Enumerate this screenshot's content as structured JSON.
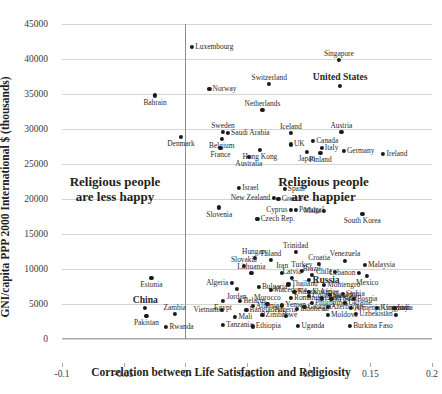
{
  "chart_data": {
    "type": "scatter",
    "title": "",
    "xlabel": "Correlation between Life Satisfaction and Religiosity",
    "ylabel": "GNI/capita PPP 2000 International $ (thousands)",
    "xlim": [
      -0.1,
      0.2
    ],
    "ylim": [
      0,
      45000
    ],
    "xticks": [
      "-0.1",
      "-0.05",
      "0",
      "0.05",
      "0.1",
      "0.15",
      "0.2"
    ],
    "xtick_values": [
      -0.1,
      -0.05,
      0,
      0.05,
      0.1,
      0.15,
      0.2
    ],
    "yticks": [
      "0",
      "5000",
      "10000",
      "15000",
      "20000",
      "25000",
      "30000",
      "35000",
      "40000",
      "45000"
    ],
    "ytick_values": [
      0,
      5000,
      10000,
      15000,
      20000,
      25000,
      30000,
      35000,
      40000,
      45000
    ],
    "grid": "horizontal",
    "legend": "none",
    "zero_reference_line_x": 0,
    "annotations": [
      {
        "name": "less-happy-note",
        "line1": "Religious people",
        "line2": "are less happy",
        "x": -0.057,
        "y": 21500
      },
      {
        "name": "happier-note",
        "line1": "Religious people",
        "line2": "are happier",
        "x": 0.112,
        "y": 21500
      }
    ],
    "points": [
      {
        "label": "Luxembourg",
        "x": 0.0055,
        "y": 41700,
        "pos": "right",
        "bold": false
      },
      {
        "label": "Singapore",
        "x": 0.1245,
        "y": 39900,
        "pos": "above",
        "bold": false
      },
      {
        "label": "Switzerland",
        "x": 0.068,
        "y": 36400,
        "pos": "above",
        "bold": false
      },
      {
        "label": "United States",
        "x": 0.1255,
        "y": 36200,
        "pos": "above",
        "bold": true
      },
      {
        "label": "Norway",
        "x": 0.0195,
        "y": 35700,
        "pos": "right",
        "bold": false
      },
      {
        "label": "Bahrain",
        "x": -0.0245,
        "y": 34800,
        "pos": "below",
        "bold": false
      },
      {
        "label": "Netherlands",
        "x": 0.0625,
        "y": 32700,
        "pos": "above",
        "bold": false
      },
      {
        "label": "Sweden",
        "x": 0.0305,
        "y": 29600,
        "pos": "above",
        "bold": false
      },
      {
        "label": "Saudi Arabia",
        "x": 0.0345,
        "y": 29500,
        "pos": "right",
        "bold": false
      },
      {
        "label": "Iceland",
        "x": 0.0855,
        "y": 29400,
        "pos": "above",
        "bold": false
      },
      {
        "label": "Austria",
        "x": 0.1265,
        "y": 29600,
        "pos": "above",
        "bold": false
      },
      {
        "label": "Denmark",
        "x": -0.0035,
        "y": 28900,
        "pos": "below",
        "bold": false
      },
      {
        "label": "Belgium",
        "x": 0.0295,
        "y": 28600,
        "pos": "below",
        "bold": false
      },
      {
        "label": "Canada",
        "x": 0.1035,
        "y": 28300,
        "pos": "right",
        "bold": false
      },
      {
        "label": "UK",
        "x": 0.0855,
        "y": 27800,
        "pos": "right",
        "bold": false
      },
      {
        "label": "France",
        "x": 0.0285,
        "y": 27300,
        "pos": "below",
        "bold": false
      },
      {
        "label": "Hong Kong",
        "x": 0.0605,
        "y": 27000,
        "pos": "below",
        "bold": false
      },
      {
        "label": "Italy",
        "x": 0.1105,
        "y": 27300,
        "pos": "right",
        "bold": false
      },
      {
        "label": "Germany",
        "x": 0.1285,
        "y": 26900,
        "pos": "right",
        "bold": false
      },
      {
        "label": "Japan",
        "x": 0.0985,
        "y": 26700,
        "pos": "below",
        "bold": false
      },
      {
        "label": "Finland",
        "x": 0.1095,
        "y": 26600,
        "pos": "below",
        "bold": false
      },
      {
        "label": "Ireland",
        "x": 0.1605,
        "y": 26400,
        "pos": "right",
        "bold": false
      },
      {
        "label": "Australia",
        "x": 0.0515,
        "y": 26000,
        "pos": "below",
        "bold": false
      },
      {
        "label": "Israel",
        "x": 0.0435,
        "y": 21600,
        "pos": "right",
        "bold": false
      },
      {
        "label": "Spain",
        "x": 0.0805,
        "y": 21500,
        "pos": "right",
        "bold": false
      },
      {
        "label": "New Zealand",
        "x": 0.0715,
        "y": 20100,
        "pos": "left",
        "bold": false
      },
      {
        "label": "Greece",
        "x": 0.0755,
        "y": 20000,
        "pos": "right",
        "bold": false
      },
      {
        "label": "Slovenia",
        "x": 0.0275,
        "y": 18800,
        "pos": "below",
        "bold": false
      },
      {
        "label": "Cyprus",
        "x": 0.0855,
        "y": 18500,
        "pos": "left",
        "bold": false
      },
      {
        "label": "Portugal",
        "x": 0.0895,
        "y": 18400,
        "pos": "right",
        "bold": false
      },
      {
        "label": "Malta",
        "x": 0.1125,
        "y": 18300,
        "pos": "left",
        "bold": false
      },
      {
        "label": "South Korea",
        "x": 0.1435,
        "y": 17900,
        "pos": "below",
        "bold": false
      },
      {
        "label": "Czech Rep.",
        "x": 0.0585,
        "y": 17100,
        "pos": "right",
        "bold": false
      },
      {
        "label": "Trinidad",
        "x": 0.0895,
        "y": 12400,
        "pos": "above",
        "bold": false
      },
      {
        "label": "Hungary",
        "x": 0.0565,
        "y": 11600,
        "pos": "above",
        "bold": false
      },
      {
        "label": "Poland",
        "x": 0.0695,
        "y": 11300,
        "pos": "above",
        "bold": false
      },
      {
        "label": "Venezuela",
        "x": 0.1295,
        "y": 11200,
        "pos": "above",
        "bold": false
      },
      {
        "label": "Croatia",
        "x": 0.1085,
        "y": 10700,
        "pos": "above",
        "bold": false
      },
      {
        "label": "Malaysia",
        "x": 0.1455,
        "y": 10600,
        "pos": "right",
        "bold": false
      },
      {
        "label": "Slovakia",
        "x": 0.0475,
        "y": 10400,
        "pos": "above",
        "bold": false
      },
      {
        "label": "Turkey",
        "x": 0.0945,
        "y": 9700,
        "pos": "above",
        "bold": false
      },
      {
        "label": "Chile",
        "x": 0.1215,
        "y": 9600,
        "pos": "left",
        "bold": false
      },
      {
        "label": "Lebanon",
        "x": 0.1405,
        "y": 9500,
        "pos": "left",
        "bold": false
      },
      {
        "label": "Lithuania",
        "x": 0.0535,
        "y": 9400,
        "pos": "above",
        "bold": false
      },
      {
        "label": "Iran",
        "x": 0.0785,
        "y": 9500,
        "pos": "above",
        "bold": false
      },
      {
        "label": "Brazil",
        "x": 0.1025,
        "y": 9100,
        "pos": "above",
        "bold": false
      },
      {
        "label": "Mexico",
        "x": 0.1475,
        "y": 9000,
        "pos": "below",
        "bold": false
      },
      {
        "label": "Estonia",
        "x": -0.0275,
        "y": 8700,
        "pos": "below",
        "bold": false
      },
      {
        "label": "Latvia",
        "x": 0.0865,
        "y": 8700,
        "pos": "above",
        "bold": false
      },
      {
        "label": "Russia",
        "x": 0.1005,
        "y": 8400,
        "pos": "right",
        "bold": true
      },
      {
        "label": "Algeria",
        "x": 0.0375,
        "y": 8000,
        "pos": "left",
        "bold": false
      },
      {
        "label": "Thailand",
        "x": 0.0835,
        "y": 7800,
        "pos": "right",
        "bold": false
      },
      {
        "label": "Montengro",
        "x": 0.1125,
        "y": 7700,
        "pos": "right",
        "bold": false
      },
      {
        "label": "Bulgaria",
        "x": 0.0595,
        "y": 7500,
        "pos": "right",
        "bold": false
      },
      {
        "label": "Jordan",
        "x": 0.0415,
        "y": 7100,
        "pos": "below",
        "bold": false
      },
      {
        "label": "Macedonia",
        "x": 0.0695,
        "y": 7000,
        "pos": "right",
        "bold": false
      },
      {
        "label": "Kazakhstan",
        "x": 0.0885,
        "y": 6700,
        "pos": "right",
        "bold": false
      },
      {
        "label": "S. Africa",
        "x": 0.1005,
        "y": 6700,
        "pos": "right",
        "bold": false
      },
      {
        "label": "Serbia",
        "x": 0.1275,
        "y": 6400,
        "pos": "right",
        "bold": false
      },
      {
        "label": "Colombia",
        "x": 0.1005,
        "y": 6100,
        "pos": "right",
        "bold": false
      },
      {
        "label": "Ecuador",
        "x": 0.1175,
        "y": 6300,
        "pos": "right",
        "bold": false
      },
      {
        "label": "Romania",
        "x": 0.0855,
        "y": 5900,
        "pos": "right",
        "bold": false
      },
      {
        "label": "Guatemala",
        "x": 0.1105,
        "y": 5800,
        "pos": "right",
        "bold": false
      },
      {
        "label": "El Salv.",
        "x": 0.1185,
        "y": 5700,
        "pos": "right",
        "bold": false
      },
      {
        "label": "Bosnia",
        "x": 0.1365,
        "y": 5700,
        "pos": "right",
        "bold": false
      },
      {
        "label": "Egypt",
        "x": 0.0305,
        "y": 5400,
        "pos": "below",
        "bold": false
      },
      {
        "label": "Belarus",
        "x": 0.0445,
        "y": 5400,
        "pos": "right",
        "bold": false
      },
      {
        "label": "Philippines",
        "x": 0.1025,
        "y": 5200,
        "pos": "right",
        "bold": false
      },
      {
        "label": "Ukraine",
        "x": 0.1295,
        "y": 5100,
        "pos": "right",
        "bold": false
      },
      {
        "label": "Morocco",
        "x": 0.0665,
        "y": 5000,
        "pos": "above",
        "bold": false
      },
      {
        "label": "Yemen",
        "x": 0.0785,
        "y": 4800,
        "pos": "right",
        "bold": false
      },
      {
        "label": "Albania",
        "x": 0.0545,
        "y": 4700,
        "pos": "right",
        "bold": false
      },
      {
        "label": "Georgia",
        "x": 0.0965,
        "y": 4600,
        "pos": "right",
        "bold": false
      },
      {
        "label": "Azerbaijan",
        "x": 0.1155,
        "y": 4600,
        "pos": "right",
        "bold": false
      },
      {
        "label": "Armenia",
        "x": 0.1345,
        "y": 4500,
        "pos": "right",
        "bold": false
      },
      {
        "label": "China",
        "x": -0.0325,
        "y": 4400,
        "pos": "above",
        "bold": true
      },
      {
        "label": "Vietnam",
        "x": 0.0295,
        "y": 4200,
        "pos": "left",
        "bold": false
      },
      {
        "label": "Bangladesh",
        "x": 0.0495,
        "y": 4200,
        "pos": "right",
        "bold": false
      },
      {
        "label": "Indonesia",
        "x": 0.0905,
        "y": 4300,
        "pos": "right",
        "bold": false
      },
      {
        "label": "Kyrgzstan",
        "x": 0.1555,
        "y": 4400,
        "pos": "right",
        "bold": false
      },
      {
        "label": "India",
        "x": 0.1695,
        "y": 4500,
        "pos": "right",
        "bold": false
      },
      {
        "label": "Zambia",
        "x": -0.0085,
        "y": 3600,
        "pos": "above",
        "bold": false
      },
      {
        "label": "Zimbabwe",
        "x": 0.0625,
        "y": 3500,
        "pos": "right",
        "bold": false
      },
      {
        "label": "Moldova",
        "x": 0.1155,
        "y": 3500,
        "pos": "right",
        "bold": false
      },
      {
        "label": "Uzbekistan",
        "x": 0.1385,
        "y": 3600,
        "pos": "right",
        "bold": false
      },
      {
        "label": "Nigeria",
        "x": 0.0815,
        "y": 3300,
        "pos": "above",
        "bold": false
      },
      {
        "label": "Pakistan",
        "x": -0.0315,
        "y": 3300,
        "pos": "below",
        "bold": false
      },
      {
        "label": "Mali",
        "x": 0.0405,
        "y": 3200,
        "pos": "right",
        "bold": false
      },
      {
        "label": "Uruguay",
        "x": 0.1705,
        "y": 3500,
        "pos": "above",
        "bold": false
      },
      {
        "label": "Rwanda",
        "x": -0.0155,
        "y": 1700,
        "pos": "right",
        "bold": false
      },
      {
        "label": "Tanzania",
        "x": 0.0305,
        "y": 2000,
        "pos": "right",
        "bold": false
      },
      {
        "label": "Ethiopia",
        "x": 0.0545,
        "y": 1800,
        "pos": "right",
        "bold": false
      },
      {
        "label": "Uganda",
        "x": 0.0915,
        "y": 1900,
        "pos": "right",
        "bold": false
      },
      {
        "label": "Burkina Faso",
        "x": 0.1335,
        "y": 1900,
        "pos": "right",
        "bold": false
      }
    ]
  }
}
